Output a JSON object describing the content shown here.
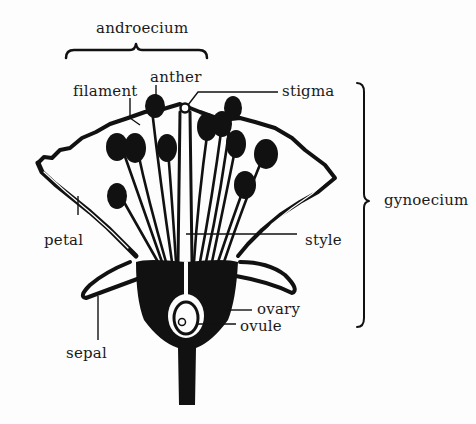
{
  "diagram": {
    "type": "botanical longitudinal section of a flower",
    "colors": {
      "ink": "#111111",
      "paper": "#fdfdfd"
    },
    "groups": [
      {
        "label": "androecium",
        "bracket": "horizontal",
        "span_x": [
          66,
          207
        ],
        "y": 50
      },
      {
        "label": "gynoecium",
        "bracket": "vertical",
        "span_y": [
          82,
          327
        ],
        "x": 364
      }
    ],
    "labels": {
      "androecium": "androecium",
      "filament": "filament",
      "anther": "anther",
      "stigma": "stigma",
      "gynoecium": "gynoecium",
      "petal": "petal",
      "style": "style",
      "ovary": "ovary",
      "ovule": "ovule",
      "sepal": "sepal"
    }
  }
}
